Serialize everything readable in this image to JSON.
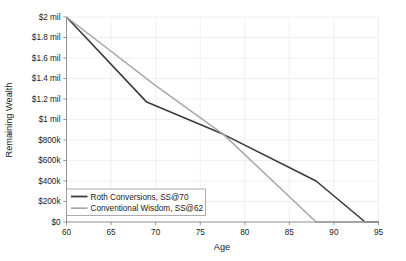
{
  "chart_data": {
    "type": "line",
    "title": "",
    "xlabel": "Age",
    "ylabel": "Remaining Wealth",
    "xlim": [
      60,
      95
    ],
    "ylim": [
      0,
      2000000
    ],
    "grid": true,
    "legend_position": "bottom-left",
    "x_ticks": [
      60,
      65,
      70,
      75,
      80,
      85,
      90,
      95
    ],
    "x_tick_labels": [
      "60",
      "65",
      "70",
      "75",
      "80",
      "85",
      "90",
      "95"
    ],
    "y_ticks": [
      0,
      200000,
      400000,
      600000,
      800000,
      1000000,
      1200000,
      1400000,
      1600000,
      1800000,
      2000000
    ],
    "y_tick_labels": [
      "$0",
      "$200k",
      "$400k",
      "$600k",
      "$800k",
      "$1 mil",
      "$1.2 mil",
      "$1.4 mil",
      "$1.6 mil",
      "$1.8 mil",
      "$2 mil"
    ],
    "series": [
      {
        "name": "Roth Conversions, SS@70",
        "color": "#3a3a3a",
        "width": 1.6,
        "x": [
          60,
          69,
          77.6,
          88,
          93.5,
          95
        ],
        "values": [
          2000000,
          1170000,
          855000,
          400000,
          0,
          0
        ]
      },
      {
        "name": "Conventional Wisdom, SS@62",
        "color": "#a8a8a8",
        "width": 1.5,
        "x": [
          60,
          70,
          77.6,
          88,
          95
        ],
        "values": [
          2000000,
          1330000,
          855000,
          0,
          0
        ]
      }
    ]
  },
  "legend": {
    "entries": [
      {
        "label": "Roth Conversions, SS@70"
      },
      {
        "label": "Conventional Wisdom, SS@62"
      }
    ]
  },
  "axes": {
    "x_title": "Age",
    "y_title": "Remaining Wealth"
  },
  "colors": {
    "roth_line": "#3a3a3a",
    "conventional_line": "#a8a8a8",
    "axis": "#8a8a8a",
    "grid": "#e8e8ea",
    "text": "#1a1a1a",
    "background": "#ffffff"
  }
}
